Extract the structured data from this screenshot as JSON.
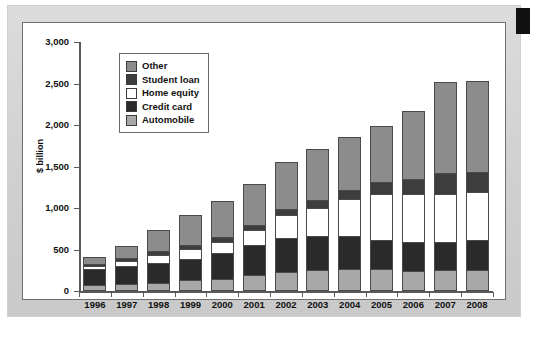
{
  "figure": {
    "edge_tab_color": "#111111",
    "card_background": "#ffffff",
    "page_background": "#d4d4d4"
  },
  "chart_data": {
    "type": "bar",
    "stacked": true,
    "title": "",
    "xlabel": "",
    "ylabel": "$ billion",
    "ylim": [
      0,
      3000
    ],
    "ytick_values": [
      0,
      500,
      1000,
      1500,
      2000,
      2500,
      3000
    ],
    "ytick_labels": [
      "0",
      "500",
      "1,000",
      "1,500",
      "2,000",
      "2,500",
      "3,000"
    ],
    "grid": false,
    "legend_position": "upper-left-inside",
    "categories": [
      "1996",
      "1997",
      "1998",
      "1999",
      "2000",
      "2001",
      "2002",
      "2003",
      "2004",
      "2005",
      "2006",
      "2007",
      "2008"
    ],
    "series": [
      {
        "name": "Automobile",
        "color": "#a8a8a8",
        "stack_order": 1,
        "values": [
          75,
          85,
          100,
          130,
          150,
          195,
          230,
          255,
          260,
          260,
          245,
          250,
          250
        ]
      },
      {
        "name": "Credit card",
        "color": "#2a2a2a",
        "stack_order": 2,
        "values": [
          190,
          215,
          240,
          260,
          305,
          365,
          410,
          405,
          400,
          360,
          345,
          340,
          360
        ]
      },
      {
        "name": "Home equity",
        "color": "#ffffff",
        "stack_order": 3,
        "values": [
          40,
          60,
          100,
          120,
          140,
          180,
          280,
          340,
          450,
          545,
          575,
          580,
          580
        ]
      },
      {
        "name": "Student loan",
        "color": "#3d3d3d",
        "stack_order": 4,
        "values": [
          25,
          35,
          45,
          50,
          55,
          55,
          65,
          95,
          110,
          150,
          190,
          255,
          250
        ]
      },
      {
        "name": "Other",
        "color": "#8c8c8c",
        "stack_order": 5,
        "values": [
          80,
          145,
          250,
          355,
          430,
          500,
          575,
          620,
          635,
          670,
          810,
          1090,
          1090
        ]
      }
    ],
    "totals": [
      410,
      540,
      735,
      915,
      1080,
      1295,
      1560,
      1715,
      1855,
      1985,
      2165,
      2515,
      2530
    ]
  },
  "legend": {
    "items": [
      {
        "label": "Other",
        "color": "#8c8c8c"
      },
      {
        "label": "Student loan",
        "color": "#3d3d3d"
      },
      {
        "label": "Home equity",
        "color": "#ffffff"
      },
      {
        "label": "Credit card",
        "color": "#2a2a2a"
      },
      {
        "label": "Automobile",
        "color": "#a8a8a8"
      }
    ]
  }
}
